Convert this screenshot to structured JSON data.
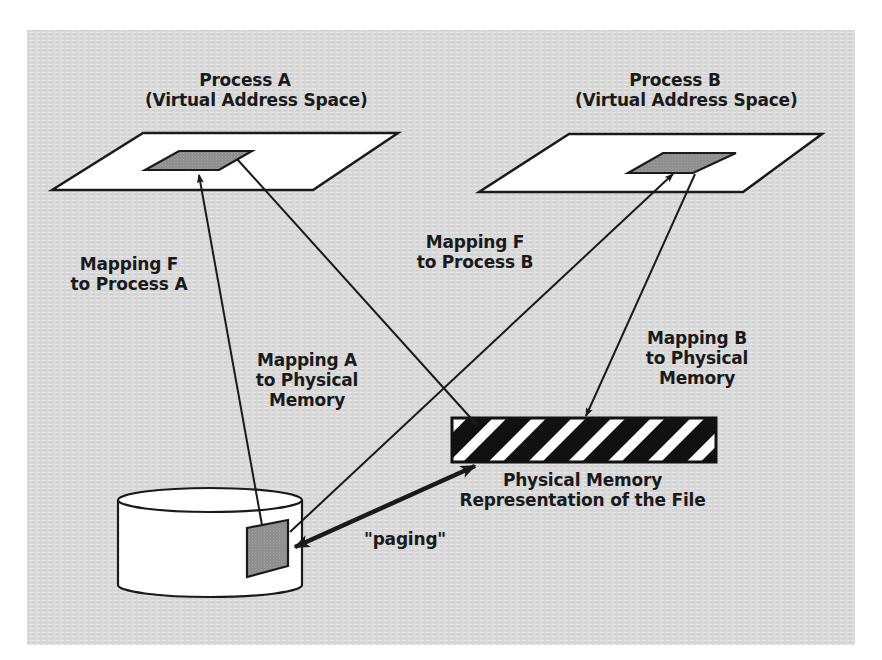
{
  "diagram": {
    "type": "memory-mapped-file",
    "colors": {
      "background_panel": "#d8d8d8",
      "page_background": "#ffffff",
      "plane_fill": "#ffffff",
      "mapped_region_fill": "#8f8f8f",
      "stroke": "#1a1a1a",
      "stripe_dark": "#111111",
      "stripe_light": "#ffffff"
    },
    "process_a": {
      "title": "Process A",
      "subtitle": "(Virtual Address Space)"
    },
    "process_b": {
      "title": "Process B",
      "subtitle": "(Virtual Address Space)"
    },
    "labels": {
      "mapping_f_a": [
        "Mapping F",
        "to Process A"
      ],
      "mapping_f_b": [
        "Mapping F",
        "to Process B"
      ],
      "mapping_a_phys": [
        "Mapping A",
        "to Physical",
        "Memory"
      ],
      "mapping_b_phys": [
        "Mapping B",
        "to Physical",
        "Memory"
      ],
      "physical_memory": [
        "Physical Memory",
        "Representation of the File"
      ],
      "paging": "\"paging\""
    },
    "nodes": [
      {
        "id": "process-a-space",
        "label": "Process A (Virtual Address Space)"
      },
      {
        "id": "process-b-space",
        "label": "Process B (Virtual Address Space)"
      },
      {
        "id": "disk-file",
        "label": "File on disk (cylinder)"
      },
      {
        "id": "physical-memory",
        "label": "Physical Memory Representation of the File"
      }
    ],
    "edges": [
      {
        "from": "disk-file",
        "to": "process-a-space",
        "label": "Mapping F to Process A"
      },
      {
        "from": "process-a-space",
        "to": "physical-memory",
        "label": "Mapping A to Physical Memory"
      },
      {
        "from": "disk-file",
        "to": "process-b-space",
        "label": "Mapping F to Process B"
      },
      {
        "from": "process-b-space",
        "to": "physical-memory",
        "label": "Mapping B to Physical Memory"
      },
      {
        "from": "disk-file",
        "to": "physical-memory",
        "label": "\"paging\"",
        "bidirectional": true
      }
    ]
  }
}
